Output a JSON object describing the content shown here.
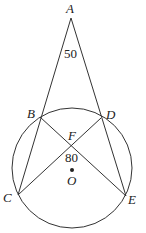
{
  "diagram": {
    "points": {
      "A": "A",
      "B": "B",
      "C": "C",
      "D": "D",
      "E": "E",
      "F": "F",
      "O": "O"
    },
    "angle_labels": {
      "angle_A": "50",
      "angle_F": "80"
    },
    "segments": [
      "AC",
      "AE",
      "BE",
      "CD"
    ],
    "circle": "circle O through B, C, D, E",
    "colors": {
      "stroke": "#333333",
      "text": "#222222",
      "background": "#ffffff"
    }
  }
}
